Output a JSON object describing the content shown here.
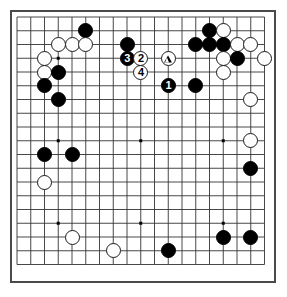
{
  "diagram": {
    "kind": "go-board-diagram",
    "board_size": 19,
    "title": "",
    "colors": {
      "board_background": "#ffffff",
      "grid_line": "#333333",
      "border": "#4a4a4a",
      "black_stone": "#000000",
      "white_stone": "#ffffff",
      "label_on_black": "#ffffff",
      "label_on_white": "#000000"
    },
    "geometry": {
      "origin_x": 10,
      "origin_y": 10,
      "cell_size": 13.75,
      "stone_diameter": 15,
      "first_point_x": 17,
      "first_point_y": 17
    },
    "star_points": [
      {
        "col": 4,
        "row": 4
      },
      {
        "col": 10,
        "row": 4
      },
      {
        "col": 16,
        "row": 4
      },
      {
        "col": 4,
        "row": 10
      },
      {
        "col": 10,
        "row": 10
      },
      {
        "col": 16,
        "row": 10
      },
      {
        "col": 4,
        "row": 16
      },
      {
        "col": 10,
        "row": 16
      },
      {
        "col": 16,
        "row": 16
      }
    ],
    "stones": [
      {
        "id": "b-e2",
        "color": "black",
        "col": 6,
        "row": 2,
        "label": "",
        "marker": ""
      },
      {
        "id": "w-c3",
        "color": "white",
        "col": 4,
        "row": 3,
        "label": "",
        "marker": ""
      },
      {
        "id": "w-d3",
        "color": "white",
        "col": 5,
        "row": 3,
        "label": "",
        "marker": ""
      },
      {
        "id": "w-e3",
        "color": "white",
        "col": 6,
        "row": 3,
        "label": "",
        "marker": ""
      },
      {
        "id": "b-h3",
        "color": "black",
        "col": 9,
        "row": 3,
        "label": "",
        "marker": ""
      },
      {
        "id": "w-b4",
        "color": "white",
        "col": 3,
        "row": 4,
        "label": "",
        "marker": ""
      },
      {
        "id": "b-h4",
        "color": "black",
        "col": 9,
        "row": 4,
        "label": "3",
        "marker": ""
      },
      {
        "id": "w-i4",
        "color": "white",
        "col": 10,
        "row": 4,
        "label": "2",
        "marker": ""
      },
      {
        "id": "w-l4",
        "color": "white",
        "col": 12,
        "row": 4,
        "label": "",
        "marker": "triangle"
      },
      {
        "id": "w-b5",
        "color": "white",
        "col": 3,
        "row": 5,
        "label": "",
        "marker": ""
      },
      {
        "id": "b-c5",
        "color": "black",
        "col": 4,
        "row": 5,
        "label": "",
        "marker": ""
      },
      {
        "id": "w-i5",
        "color": "white",
        "col": 10,
        "row": 5,
        "label": "4",
        "marker": ""
      },
      {
        "id": "b-b6",
        "color": "black",
        "col": 3,
        "row": 6,
        "label": "",
        "marker": ""
      },
      {
        "id": "b-l6",
        "color": "black",
        "col": 12,
        "row": 6,
        "label": "1",
        "marker": ""
      },
      {
        "id": "b-n6",
        "color": "black",
        "col": 14,
        "row": 6,
        "label": "",
        "marker": ""
      },
      {
        "id": "b-c7",
        "color": "black",
        "col": 4,
        "row": 7,
        "label": "",
        "marker": ""
      },
      {
        "id": "b-o2",
        "color": "black",
        "col": 15,
        "row": 2,
        "label": "",
        "marker": ""
      },
      {
        "id": "w-p2",
        "color": "white",
        "col": 16,
        "row": 2,
        "label": "",
        "marker": ""
      },
      {
        "id": "b-n3",
        "color": "black",
        "col": 14,
        "row": 3,
        "label": "",
        "marker": ""
      },
      {
        "id": "b-o3",
        "color": "black",
        "col": 15,
        "row": 3,
        "label": "",
        "marker": ""
      },
      {
        "id": "b-p3",
        "color": "black",
        "col": 16,
        "row": 3,
        "label": "",
        "marker": ""
      },
      {
        "id": "w-q3",
        "color": "white",
        "col": 17,
        "row": 3,
        "label": "",
        "marker": ""
      },
      {
        "id": "w-r3",
        "color": "white",
        "col": 18,
        "row": 3,
        "label": "",
        "marker": ""
      },
      {
        "id": "w-p4",
        "color": "white",
        "col": 16,
        "row": 4,
        "label": "",
        "marker": ""
      },
      {
        "id": "b-q4",
        "color": "black",
        "col": 17,
        "row": 4,
        "label": "",
        "marker": ""
      },
      {
        "id": "w-s4",
        "color": "white",
        "col": 19,
        "row": 4,
        "label": "",
        "marker": ""
      },
      {
        "id": "w-p5",
        "color": "white",
        "col": 16,
        "row": 5,
        "label": "",
        "marker": ""
      },
      {
        "id": "w-r7",
        "color": "white",
        "col": 18,
        "row": 7,
        "label": "",
        "marker": ""
      },
      {
        "id": "w-r10",
        "color": "white",
        "col": 18,
        "row": 10,
        "label": "",
        "marker": ""
      },
      {
        "id": "b-r12",
        "color": "black",
        "col": 18,
        "row": 12,
        "label": "",
        "marker": ""
      },
      {
        "id": "b-b11",
        "color": "black",
        "col": 3,
        "row": 11,
        "label": "",
        "marker": ""
      },
      {
        "id": "b-d11",
        "color": "black",
        "col": 5,
        "row": 11,
        "label": "",
        "marker": ""
      },
      {
        "id": "w-b13",
        "color": "white",
        "col": 3,
        "row": 13,
        "label": "",
        "marker": ""
      },
      {
        "id": "w-d17",
        "color": "white",
        "col": 5,
        "row": 17,
        "label": "",
        "marker": ""
      },
      {
        "id": "w-h18",
        "color": "white",
        "col": 8,
        "row": 18,
        "label": "",
        "marker": ""
      },
      {
        "id": "b-l18",
        "color": "black",
        "col": 12,
        "row": 18,
        "label": "",
        "marker": ""
      },
      {
        "id": "b-p17",
        "color": "black",
        "col": 16,
        "row": 17,
        "label": "",
        "marker": ""
      },
      {
        "id": "b-r17",
        "color": "black",
        "col": 18,
        "row": 17,
        "label": "",
        "marker": ""
      }
    ],
    "move_sequence": [
      {
        "number": "1",
        "color": "black",
        "col": 12,
        "row": 6
      },
      {
        "number": "2",
        "color": "white",
        "col": 10,
        "row": 4
      },
      {
        "number": "3",
        "color": "black",
        "col": 9,
        "row": 4
      },
      {
        "number": "4",
        "color": "white",
        "col": 10,
        "row": 5
      }
    ]
  }
}
